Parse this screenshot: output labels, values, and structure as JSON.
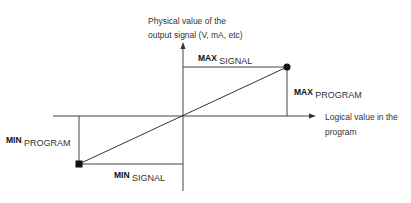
{
  "diagram": {
    "y_axis_label_line1": "Physical value of the",
    "y_axis_label_line2": "output signal (V, mA, etc)",
    "x_axis_label_line1": "Logical value in the",
    "x_axis_label_line2": "program",
    "max_signal": {
      "main": "MAX",
      "sub": "SIGNAL"
    },
    "max_program": {
      "main": "MAX",
      "sub": "PROGRAM"
    },
    "min_program": {
      "main": "MIN",
      "sub": "PROGRAM"
    },
    "min_signal": {
      "main": "MIN",
      "sub": "SIGNAL"
    },
    "colors": {
      "line": "#444444",
      "marker": "#111111"
    }
  }
}
